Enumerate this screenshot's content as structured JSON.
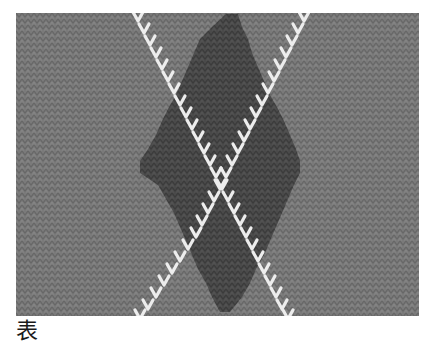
{
  "figure": {
    "caption": "表",
    "colors": {
      "background_knit": "#7a7a7a",
      "background_knit_shadow": "#666666",
      "diamond": "#4a4a4a",
      "diamond_shadow": "#3c3c3c",
      "line_stitch": "#ededed"
    },
    "diamond": {
      "top": [
        218,
        1
      ],
      "right": [
        284,
        152
      ],
      "bottom": [
        202,
        299
      ],
      "left": [
        124,
        152
      ]
    },
    "diagonals": [
      {
        "name": "left-to-right",
        "from": [
          120,
          0
        ],
        "to": [
          290,
          303
        ]
      },
      {
        "name": "right-to-left",
        "from": [
          290,
          0
        ],
        "to": [
          120,
          303
        ]
      }
    ]
  }
}
